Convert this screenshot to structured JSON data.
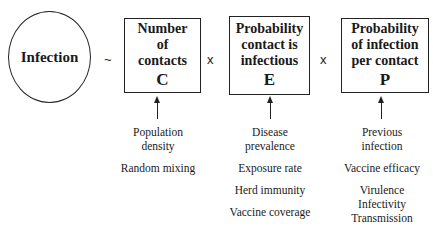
{
  "outcome": {
    "label": "Infection",
    "operator": "~"
  },
  "factors": [
    {
      "title_lines": [
        "Number",
        "of",
        "contacts"
      ],
      "symbol": "C",
      "operator_after": "x",
      "determinants": [
        "Population\ndensity",
        "Random mixing"
      ]
    },
    {
      "title_lines": [
        "Probability",
        "contact is",
        "infectious"
      ],
      "symbol": "E",
      "operator_after": "x",
      "determinants": [
        "Disease\nprevalence",
        "Exposure rate",
        "Herd immunity",
        "Vaccine coverage"
      ]
    },
    {
      "title_lines": [
        "Probability",
        "of infection",
        "per contact"
      ],
      "symbol": "P",
      "operator_after": null,
      "determinants": [
        "Previous\ninfection",
        "Vaccine efficacy",
        "Virulence\nInfectivity\nTransmission"
      ]
    }
  ]
}
